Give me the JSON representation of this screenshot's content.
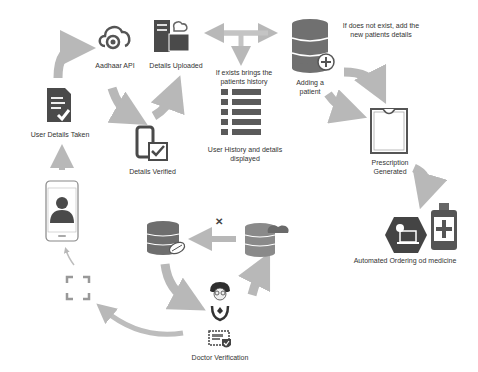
{
  "colors": {
    "icon_dark": "#4a4a4a",
    "icon_mid": "#777777",
    "arrow": "#b5b5b5",
    "text": "#333333"
  },
  "nodes": {
    "aadhaar_api": {
      "label": "Aadhaar API",
      "icon": "cloud-fingerprint-icon"
    },
    "details_uploaded": {
      "label": "Details Uploaded",
      "icon": "server-folder-cloud-icon"
    },
    "details_verified": {
      "label": "Details Verified",
      "icon": "phone-check-icon"
    },
    "user_details_taken": {
      "label": "User Details Taken",
      "icon": "document-check-icon"
    },
    "exists_note": {
      "label_line1": "If exists brings the",
      "label_line2": "patients history"
    },
    "user_history": {
      "label_line1": "User History and details",
      "label_line2": "displayed",
      "icon": "list-icon"
    },
    "adding_patient": {
      "label_line1": "Adding a",
      "label_line2": "patient",
      "icon": "database-plus-icon"
    },
    "not_exist_note": {
      "label_line1": "If does not exist, add the",
      "label_line2": "new patients details"
    },
    "prescription": {
      "label_line1": "Prescription",
      "label_line2": "Generated",
      "icon": "clipboard-icon"
    },
    "automated_ordering": {
      "label": "Automated Ordering od medicine",
      "icon": "medicine-bottle-icon"
    },
    "doctor_verification": {
      "label": "Doctor Verification",
      "icon": "doctor-certificate-icon"
    },
    "mobile_user": {
      "icon": "phone-user-icon"
    },
    "scan": {
      "icon": "scan-frame-icon"
    },
    "db_pill": {
      "icon": "database-pill-icon"
    },
    "db_cloud": {
      "icon": "database-cloud-icon"
    },
    "cross_mark": {
      "text": "✕"
    }
  }
}
